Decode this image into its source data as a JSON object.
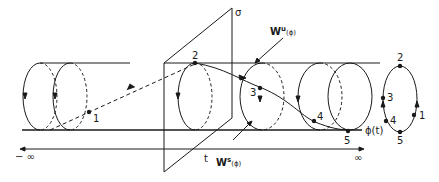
{
  "diagram": {
    "type": "tube-flow-geometry",
    "labels": {
      "sigma": "σ",
      "unstable_manifold_main": "W",
      "unstable_manifold_sup": "u",
      "unstable_manifold_arg": "(ϕ)",
      "stable_manifold_main": "W",
      "stable_manifold_sup": "s",
      "stable_manifold_arg": "(ϕ)",
      "trajectory": "ϕ(t)",
      "time": "t",
      "neg_infinity": "− ∞",
      "pos_infinity": "∞"
    },
    "points_on_tube": [
      "1",
      "2",
      "3",
      "4",
      "5"
    ],
    "points_on_orbit": [
      "2",
      "3",
      "4",
      "1",
      "5"
    ],
    "colors": {
      "stroke": "#1a1a1a",
      "background": "#ffffff"
    }
  }
}
